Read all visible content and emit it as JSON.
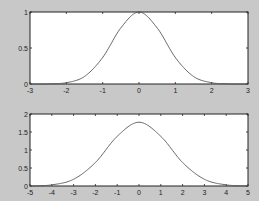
{
  "figure": {
    "background": "#c8c8c8",
    "axes_background": "#ffffff",
    "line_color": "#555555"
  },
  "chart_data": [
    {
      "type": "line",
      "title": "",
      "xlabel": "",
      "ylabel": "",
      "xlim": [
        -3,
        3
      ],
      "ylim": [
        0,
        1
      ],
      "xticks": [
        "-3",
        "-2",
        "-1",
        "0",
        "1",
        "2",
        "3"
      ],
      "yticks": [
        "0",
        "0.5",
        "1"
      ],
      "grid": false,
      "series": [
        {
          "name": "exp(-x^2)",
          "x": [
            -3,
            -2.5,
            -2,
            -1.5,
            -1,
            -0.5,
            0,
            0.5,
            1,
            1.5,
            2,
            2.5,
            3
          ],
          "values": [
            0.0,
            0.002,
            0.018,
            0.105,
            0.368,
            0.779,
            1.0,
            0.779,
            0.368,
            0.105,
            0.018,
            0.002,
            0.0
          ]
        }
      ]
    },
    {
      "type": "line",
      "title": "",
      "xlabel": "",
      "ylabel": "",
      "xlim": [
        -5,
        5
      ],
      "ylim": [
        0,
        2
      ],
      "xticks": [
        "-5",
        "-4",
        "-3",
        "-2",
        "-1",
        "0",
        "1",
        "2",
        "3",
        "4",
        "5"
      ],
      "yticks": [
        "0",
        "0.5",
        "1",
        "1.5",
        "2"
      ],
      "grid": false,
      "series": [
        {
          "name": "sqrt(pi)*exp(-x^2/4)",
          "x": [
            -5,
            -4,
            -3,
            -2,
            -1,
            0,
            1,
            2,
            3,
            4,
            5
          ],
          "values": [
            0.003,
            0.032,
            0.187,
            0.652,
            1.38,
            1.772,
            1.38,
            0.652,
            0.187,
            0.032,
            0.003
          ]
        }
      ]
    }
  ]
}
